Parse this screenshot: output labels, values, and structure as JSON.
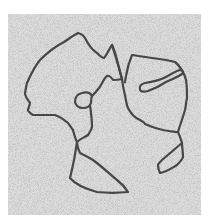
{
  "image": {
    "subject": "Electron micrograph of DNA molecule strands with loops",
    "caption": "DNA strands on speckled background",
    "background_color": "#ffffff",
    "field_color": "#c9c9c9",
    "strand_color": "#474747",
    "field": {
      "x": 8,
      "y": 14,
      "width": 193,
      "height": 201
    },
    "strand_width": 2.2,
    "paths": [
      {
        "name": "left-main-loop",
        "d": "M78,33 C82,34 84,36 85,38 C88,44 92,50 97,53 C100,56 102,58 104,58 C107,55 109,49 112,45 C115,50 117,60 119,68 C120,73 121,76 122,79 M122,79 C118,80 115,80 113,80 C111,77 109,75 107,76 C104,78 102,84 99,88 C96,92 93,95 92,96 M73,130 C70,126 69,124 68,123 C62,118 58,116 55,115 C47,115 39,115 33,115 C30,113 28,111 28,110 C29,106 30,104 30,103 C27,99 25,96 25,93 C26,89 26,86 27,83 C31,74 35,66 40,60 C48,52 56,46 64,42 C70,38 74,35 78,33"
      },
      {
        "name": "small-circle-loop",
        "d": "M92,96 C90,92 86,92 82,93 C77,94 75,98 75,102 C76,106 79,108 83,108 C87,108 90,106 91,103 C91,100 91,98 92,96"
      },
      {
        "name": "center-descending-strand",
        "d": "M90,105 C91,112 92,120 92,127 C91,131 89,133 88,135 C85,137 80,139 77,142"
      },
      {
        "name": "bottom-left-loop",
        "d": "M77,142 C76,148 75,155 74,160 C73,165 72,170 70,178 C75,184 86,189 97,192 C107,193 118,193 128,192 C125,187 121,183 117,180 C110,174 101,166 93,160 C88,157 84,155 80,153 C78,149 77,146 77,142"
      },
      {
        "name": "left-loop-bottom-strand",
        "d": "M73,130 C74,134 75,138 77,142"
      },
      {
        "name": "right-loop",
        "d": "M112,45 C116,58 120,70 122,79 C123,86 124,92 125,95 C126,101 127,106 128,108 C131,114 135,118 140,120 C143,122 145,123 145,124 C152,127 158,129 163,130 C169,131 174,132 178,132 C180,125 183,117 185,110 C186,106 186,102 187,98 C187,92 187,86 186,80 C185,76 184,74 183,72 C180,67 178,64 175,62 C168,60 160,59 152,58 C145,57 138,56 132,55 C129,62 127,70 126,76 C125,80 125,83 125,82"
      },
      {
        "name": "right-inner-elongated-loop",
        "d": "M140,90 C139,86 141,84 145,83 C152,82 160,80 166,77 C171,74 176,71 180,70 C183,70 184,72 182,74 C178,77 172,79 166,82 C160,86 154,89 148,91 C144,92 141,92 140,90"
      },
      {
        "name": "right-lower-connector",
        "d": "M178,132 C180,136 181,140 182,143 C182,147 183,152 183,157"
      },
      {
        "name": "bottom-right-loop",
        "d": "M182,143 C176,148 168,155 162,160 C159,163 158,164 158,165 C158,168 159,171 160,173 C166,172 172,168 177,165 C180,162 182,160 183,157"
      }
    ]
  }
}
